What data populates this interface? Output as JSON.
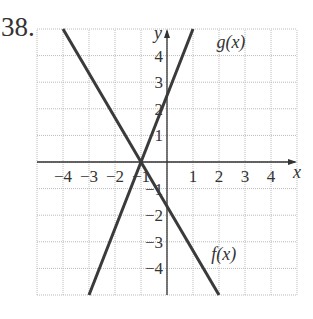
{
  "problem_number": "38.",
  "chart_data": {
    "type": "line",
    "title": "",
    "xlabel": "x",
    "ylabel": "y",
    "xlim": [
      -5,
      5
    ],
    "ylim": [
      -5,
      5
    ],
    "grid": true,
    "x_ticks": [
      -4,
      -3,
      -2,
      -1,
      1,
      2,
      3,
      4
    ],
    "x_tick_labels": [
      "−4",
      "−3",
      "−2",
      "−1",
      "1",
      "2",
      "3",
      "4"
    ],
    "y_ticks": [
      4,
      3,
      2,
      1,
      -1,
      -2,
      -3,
      -4
    ],
    "y_tick_labels": [
      "4",
      "3",
      "2",
      "1",
      "−1",
      "−2",
      "−3",
      "−4"
    ],
    "series": [
      {
        "name": "f(x)",
        "points": [
          [
            -4,
            5
          ],
          [
            -1,
            0
          ],
          [
            2,
            -5
          ]
        ],
        "label": "f(x)",
        "label_at": [
          1.7,
          -3.7
        ]
      },
      {
        "name": "g(x)",
        "points": [
          [
            -3,
            -5
          ],
          [
            -1,
            0
          ],
          [
            1,
            5
          ]
        ],
        "label": "g(x)",
        "label_at": [
          1.9,
          4.3
        ]
      }
    ]
  }
}
